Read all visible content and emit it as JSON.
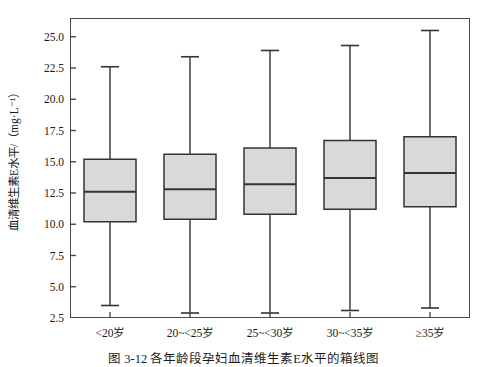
{
  "figure": {
    "caption": "图 3-12  各年龄段孕妇血清维生素E水平的箱线图",
    "background_color": "#ffffff",
    "box_fill_color": "#d9d9d9",
    "line_color": "#333333",
    "frame_color": "#4a4a4a"
  },
  "chart_data": {
    "type": "box",
    "title": "",
    "xlabel": "",
    "ylabel": "血清维生素E水平/（mg·L⁻¹）",
    "ylim": [
      2.5,
      26.5
    ],
    "yticks": [
      2.5,
      5.0,
      7.5,
      10.0,
      12.5,
      15.0,
      17.5,
      20.0,
      22.5,
      25.0
    ],
    "ytick_labels": [
      "2.5",
      "5.0",
      "7.5",
      "10.0",
      "12.5",
      "15.0",
      "17.5",
      "20.0",
      "22.5",
      "25.0"
    ],
    "grid": false,
    "legend": null,
    "categories": [
      "<20岁",
      "20~<25岁",
      "25~<30岁",
      "30~<35岁",
      "≥35岁"
    ],
    "boxes": [
      {
        "category": "<20岁",
        "whisker_low": 3.5,
        "q1": 10.2,
        "median": 12.6,
        "q3": 15.2,
        "whisker_high": 22.6
      },
      {
        "category": "20~<25岁",
        "whisker_low": 2.9,
        "q1": 10.4,
        "median": 12.8,
        "q3": 15.6,
        "whisker_high": 23.4
      },
      {
        "category": "25~<30岁",
        "whisker_low": 2.9,
        "q1": 10.8,
        "median": 13.2,
        "q3": 16.1,
        "whisker_high": 23.9
      },
      {
        "category": "30~<35岁",
        "whisker_low": 3.1,
        "q1": 11.2,
        "median": 13.7,
        "q3": 16.7,
        "whisker_high": 24.3
      },
      {
        "category": "≥35岁",
        "whisker_low": 3.3,
        "q1": 11.4,
        "median": 14.1,
        "q3": 17.0,
        "whisker_high": 25.5
      }
    ]
  }
}
